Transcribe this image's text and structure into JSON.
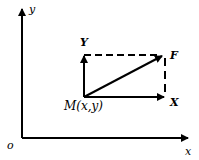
{
  "diagram": {
    "axes": {
      "origin_label": "o",
      "x_label": "x",
      "y_label": "y"
    },
    "point": {
      "label": "M(x,y)"
    },
    "vectors": {
      "resultant": "F",
      "x_component": "X",
      "y_component": "Y"
    },
    "colors": {
      "stroke": "#000000",
      "background": "#ffffff"
    }
  }
}
